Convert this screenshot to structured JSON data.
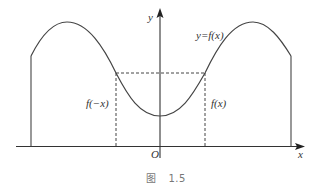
{
  "diagram": {
    "type": "function-graph",
    "colors": {
      "curve": "#444444",
      "axes": "#333333",
      "dashed": "#444444",
      "text": "#333333",
      "caption": "#777777"
    },
    "labels": {
      "y_axis": "y",
      "x_axis": "x",
      "origin": "O",
      "curve": "y=f(x)",
      "left_value": "f(−x)",
      "right_value": "f(x)"
    },
    "caption": {
      "prefix": "图",
      "number": "1.5"
    }
  }
}
